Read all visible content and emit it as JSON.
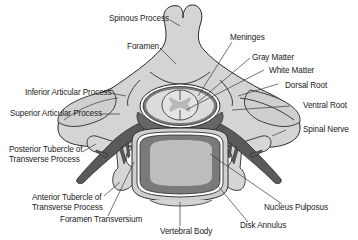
{
  "diagram": {
    "colors": {
      "background": "#ffffff",
      "bone_light": "#d4d4d4",
      "bone_mid": "#c2c2c2",
      "outline": "#2a2a2a",
      "nerve_dark": "#5a5a5a",
      "disk_dark": "#7a7a7a",
      "nucleus": "#b8b8b8",
      "cord_gray": "#bdbdbd",
      "cord_white": "#e6e6e6"
    },
    "labels": {
      "spinous_process": "Spinous Process",
      "foramen": "Foramen",
      "meninges": "Meninges",
      "gray_matter": "Gray Matter",
      "white_matter": "White Matter",
      "dorsal_root": "Dorsal Root",
      "ventral_root": "Ventral Root",
      "inferior_articular_process": "Inferior Articular Process",
      "superior_articular_process": "Superior Articular Process",
      "spinal_nerve": "Spinal Nerve",
      "posterior_tubercle": "Posterior Tubercle of\nTransverse Process",
      "anterior_tubercle": "Anterior Tubercle of\nTransverse Process",
      "foramen_transversium": "Foramen Transversium",
      "nucleus_pulposus": "Nucleus Pulposus",
      "vertebral_body": "Vertebral Body",
      "disk_annulus": "Disk Annulus"
    }
  }
}
